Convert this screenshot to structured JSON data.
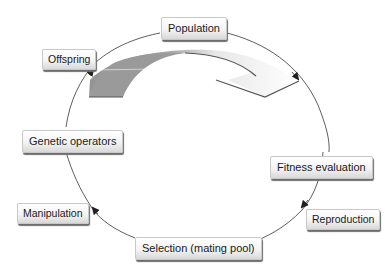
{
  "diagram": {
    "type": "cycle",
    "stages": [
      {
        "id": "population",
        "label": "Population"
      },
      {
        "id": "fitness-evaluation",
        "label": "Fitness evaluation"
      },
      {
        "id": "selection",
        "label": "Selection (mating pool)"
      },
      {
        "id": "genetic-operators",
        "label": "Genetic operators"
      }
    ],
    "transitions": [
      {
        "from": "population",
        "to": "fitness-evaluation",
        "label": ""
      },
      {
        "from": "fitness-evaluation",
        "to": "selection",
        "label": "Reproduction"
      },
      {
        "from": "selection",
        "to": "genetic-operators",
        "label": "Manipulation"
      },
      {
        "from": "genetic-operators",
        "to": "population",
        "label": "Offspring"
      }
    ],
    "colors": {
      "line": "#333333",
      "arrow_dark": "#8c8c8c",
      "arrow_light": "#f2f2f2"
    }
  }
}
